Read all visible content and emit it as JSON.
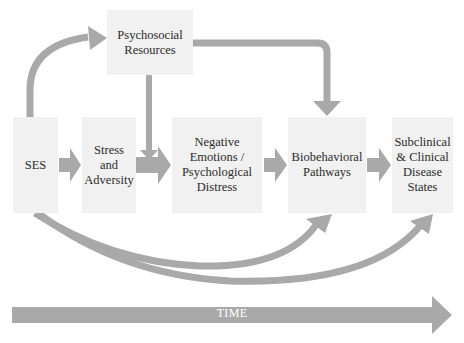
{
  "diagram": {
    "nodes": [
      {
        "id": "psychosocial",
        "label": "Psychosocial Resources",
        "lines": [
          "Psychosocial",
          "Resources"
        ]
      },
      {
        "id": "ses",
        "label": "SES",
        "lines": [
          "SES"
        ]
      },
      {
        "id": "stress",
        "label": "Stress and Adversity",
        "lines": [
          "Stress and",
          "Adversity"
        ]
      },
      {
        "id": "negative",
        "label": "Negative Emotions / Psychological Distress",
        "lines": [
          "Negative",
          "Emotions /",
          "Psychological",
          "Distress"
        ]
      },
      {
        "id": "biobehavioral",
        "label": "Biobehavioral Pathways",
        "lines": [
          "Biobehavioral",
          "Pathways"
        ]
      },
      {
        "id": "disease",
        "label": "Subclinical & Clinical Disease States",
        "lines": [
          "Subclinical",
          "& Clinical",
          "Disease",
          "States"
        ]
      }
    ],
    "edges": [
      {
        "from": "ses",
        "to": "psychosocial",
        "style": "curved-up"
      },
      {
        "from": "ses",
        "to": "stress"
      },
      {
        "from": "stress",
        "to": "negative"
      },
      {
        "from": "psychosocial",
        "to": "negative",
        "style": "vertical-down"
      },
      {
        "from": "psychosocial",
        "to": "biobehavioral",
        "style": "elbow"
      },
      {
        "from": "negative",
        "to": "biobehavioral"
      },
      {
        "from": "biobehavioral",
        "to": "disease"
      },
      {
        "from": "ses",
        "to": "biobehavioral",
        "style": "curved-under"
      },
      {
        "from": "ses",
        "to": "disease",
        "style": "curved-under"
      }
    ],
    "timeline": {
      "label": "TIME"
    },
    "colors": {
      "box_fill": "#f1f1f1",
      "arrow": "#a9a9a9",
      "text": "#2b2b2b",
      "time_text": "#ffffff"
    }
  }
}
